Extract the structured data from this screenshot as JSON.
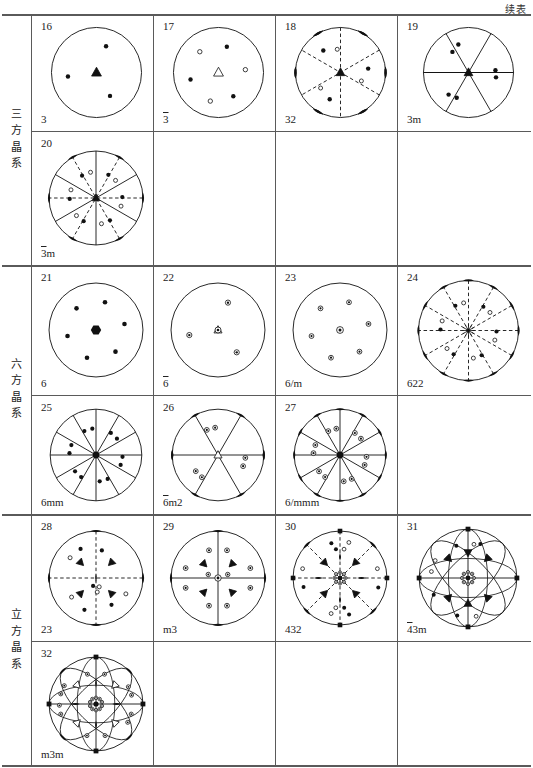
{
  "page": {
    "continued_label": "续表",
    "doc_type": "crystallographic point-group stereogram table"
  },
  "systems": [
    {
      "id": "trigonal",
      "name_cn": "三方晶系",
      "chars": [
        "三",
        "方",
        "晶",
        "系"
      ]
    },
    {
      "id": "hexagonal",
      "name_cn": "六方晶系",
      "chars": [
        "六",
        "方",
        "晶",
        "系"
      ]
    },
    {
      "id": "cubic",
      "name_cn": "立方晶系",
      "chars": [
        "立",
        "方",
        "晶",
        "系"
      ]
    }
  ],
  "diagrams": [
    {
      "num": "16",
      "symbol": "3",
      "overline": false,
      "row": 0,
      "col": 0
    },
    {
      "num": "17",
      "symbol": "3",
      "overline": true,
      "row": 0,
      "col": 1
    },
    {
      "num": "18",
      "symbol": "32",
      "overline": false,
      "row": 0,
      "col": 2
    },
    {
      "num": "19",
      "symbol": "3m",
      "overline": false,
      "row": 0,
      "col": 3
    },
    {
      "num": "20",
      "symbol": "3m",
      "overline": true,
      "row": 1,
      "col": 0
    },
    {
      "num": "21",
      "symbol": "6",
      "overline": false,
      "row": 2,
      "col": 0
    },
    {
      "num": "22",
      "symbol": "6",
      "overline": true,
      "row": 2,
      "col": 1
    },
    {
      "num": "23",
      "symbol": "6/m",
      "overline": false,
      "row": 2,
      "col": 2
    },
    {
      "num": "24",
      "symbol": "622",
      "overline": false,
      "row": 2,
      "col": 3
    },
    {
      "num": "25",
      "symbol": "6mm",
      "overline": false,
      "row": 3,
      "col": 0
    },
    {
      "num": "26",
      "symbol": "6m2",
      "overline": true,
      "row": 3,
      "col": 1
    },
    {
      "num": "27",
      "symbol": "6/mmm",
      "overline": false,
      "row": 3,
      "col": 2
    },
    {
      "num": "28",
      "symbol": "23",
      "overline": false,
      "row": 4,
      "col": 0
    },
    {
      "num": "29",
      "symbol": "m3",
      "overline": false,
      "row": 4,
      "col": 1
    },
    {
      "num": "30",
      "symbol": "432",
      "overline": false,
      "row": 4,
      "col": 2
    },
    {
      "num": "31",
      "symbol": "43m",
      "overline": true,
      "row": 4,
      "col": 3
    },
    {
      "num": "32",
      "symbol": "m3m",
      "overline": false,
      "row": 5,
      "col": 0
    }
  ],
  "legend": {
    "filled_circle": "upper-hemisphere pole",
    "open_circle": "lower-hemisphere pole",
    "triangle": "3-fold axis",
    "lens": "2-fold axis",
    "hexagon": "6-fold axis",
    "square": "4-fold axis",
    "solid_line": "mirror plane",
    "dashed_line": "2-fold axis trace"
  },
  "colors": {
    "ink": "#111111",
    "rule": "#5a5a5a",
    "background": "#ffffff"
  },
  "geometry": {
    "col_x": [
      29,
      151,
      273,
      395
    ],
    "col_w": [
      122,
      122,
      122,
      134
    ],
    "row_y": [
      0,
      117,
      251,
      381,
      500,
      627
    ],
    "row_h": [
      117,
      134,
      130,
      119,
      127,
      125
    ]
  }
}
